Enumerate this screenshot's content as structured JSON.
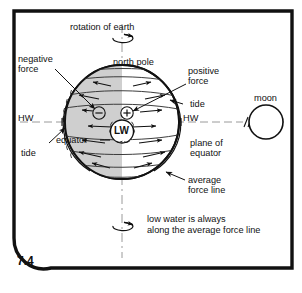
{
  "figure": {
    "number": "7.4",
    "caption_note": "low water is always along the average force line"
  },
  "labels": {
    "rotation_of_earth": "rotation of earth",
    "north_pole": "north pole",
    "negative_force_l1": "negative",
    "negative_force_l2": "force",
    "positive_force_l1": "positive",
    "positive_force_l2": "force",
    "tide_right": "tide",
    "tide_left": "tide",
    "hw_left": "HW",
    "hw_right": "HW",
    "lw_center": "LW",
    "equator": "equator",
    "moon": "moon",
    "plane_of_equator_l1": "plane of",
    "plane_of_equator_l2": "equator",
    "average_force_line_l1": "average",
    "average_force_line_l2": "force line",
    "note_l1": "low water is always",
    "note_l2": "along the average force line",
    "plus_sign": "+",
    "minus_sign": "−"
  },
  "colors": {
    "frame": "#111111",
    "earth_shaded_half": "#cfcfcf",
    "earth_light_half": "#ffffff",
    "line": "#111111",
    "axis_dash": "#8c8c8c",
    "force_line": "#3a3a3a",
    "text": "#111111",
    "background": "#ffffff"
  },
  "diagram": {
    "type": "schematic",
    "earth": {
      "center_x": 122,
      "center_y": 122,
      "radius": 57,
      "shaded_half": "left",
      "tide_envelope": "wavy outer water line offset outward on the left and right limbs"
    },
    "moon": {
      "center_x": 266,
      "center_y": 122,
      "radius": 17
    },
    "axis": {
      "label": "rotation axis",
      "orientation": "vertical",
      "style": "dash-dot"
    },
    "equator_plane": {
      "style": "dashed",
      "break_mark": "//",
      "y": 122
    },
    "rotation_indicators": [
      {
        "position": "top",
        "direction": "counterclockwise-to-east"
      },
      {
        "position": "bottom",
        "direction": "counterclockwise-to-east"
      }
    ],
    "force_halves": [
      {
        "sign": "negative",
        "side": "left",
        "marker": "−",
        "arrow_direction": "outward / away from moon"
      },
      {
        "sign": "positive",
        "side": "right",
        "marker": "+",
        "arrow_direction": "toward moon"
      }
    ],
    "high_water_points": [
      "left limb HW",
      "right limb HW"
    ],
    "low_water_point": "LW at earth centre on the average force line"
  }
}
